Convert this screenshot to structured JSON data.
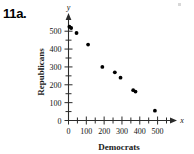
{
  "figure": {
    "problem_label": "11a.",
    "axis_arrow_y_var": "y",
    "axis_arrow_x_var": "x"
  },
  "chart_data": {
    "type": "scatter",
    "title": "",
    "xlabel": "Democrats",
    "ylabel": "Republicans",
    "xlim": [
      0,
      550
    ],
    "ylim": [
      0,
      560
    ],
    "xticks": [
      0,
      100,
      200,
      300,
      400,
      500
    ],
    "yticks": [
      0,
      100,
      200,
      300,
      400,
      500
    ],
    "xtick_labels": [
      "0",
      "100",
      "200",
      "300",
      "400",
      "500"
    ],
    "ytick_labels": [
      "0",
      "100",
      "200",
      "300",
      "400",
      "500"
    ],
    "minor_tick_step_x": 50,
    "minor_tick_step_y": 50,
    "grid": false,
    "legend": false,
    "marker": "filled-circle",
    "marker_color": "#000000",
    "points": [
      {
        "x": 5,
        "y": 525
      },
      {
        "x": 15,
        "y": 518
      },
      {
        "x": 45,
        "y": 490
      },
      {
        "x": 110,
        "y": 425
      },
      {
        "x": 190,
        "y": 300
      },
      {
        "x": 260,
        "y": 270
      },
      {
        "x": 292,
        "y": 240
      },
      {
        "x": 363,
        "y": 170
      },
      {
        "x": 376,
        "y": 162
      },
      {
        "x": 485,
        "y": 55
      }
    ]
  }
}
